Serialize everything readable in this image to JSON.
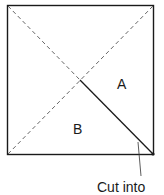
{
  "diagram": {
    "square": {
      "x": 7,
      "y": 5,
      "size_w": 147,
      "size_h": 150
    },
    "labels": {
      "region_a": "A",
      "region_b": "B",
      "caption": "Cut into"
    },
    "lines": {
      "fold_diagonal": "dashed",
      "cut_diagonal_first_half": "dashed",
      "cut_diagonal_second_half": "solid"
    },
    "colors": {
      "stroke": "#1a1a1a",
      "dashed": "#555555",
      "background": "#ffffff"
    }
  }
}
